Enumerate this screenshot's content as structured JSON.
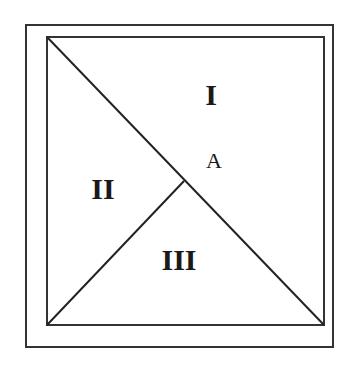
{
  "diagram": {
    "labels": {
      "region_1": "I",
      "region_2": "II",
      "region_3": "III",
      "point_a": "A"
    },
    "colors": {
      "stroke": "#222222",
      "background": "#ffffff"
    }
  }
}
